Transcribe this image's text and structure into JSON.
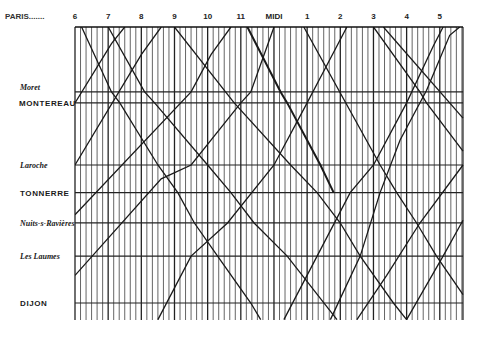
{
  "chart_data": {
    "type": "line",
    "title": "",
    "xlabel": "",
    "ylabel": "",
    "grid": true,
    "x_ticks": [
      {
        "hour": 6,
        "label": "6"
      },
      {
        "hour": 7,
        "label": "7"
      },
      {
        "hour": 8,
        "label": "8"
      },
      {
        "hour": 9,
        "label": "9"
      },
      {
        "hour": 10,
        "label": "10"
      },
      {
        "hour": 11,
        "label": "11"
      },
      {
        "hour": 12,
        "label": "MIDI"
      },
      {
        "hour": 13,
        "label": "1"
      },
      {
        "hour": 14,
        "label": "2"
      },
      {
        "hour": 15,
        "label": "3"
      },
      {
        "hour": 16,
        "label": "4"
      },
      {
        "hour": 17,
        "label": "5"
      }
    ],
    "xlim": [
      6,
      17.7
    ],
    "minor_ticks_per_hour": 6,
    "paris_leader": "PARIS.......",
    "stations": [
      {
        "name": "PARIS",
        "style": "roman",
        "pos": 0,
        "show_label": false
      },
      {
        "name": "Moret",
        "style": "italic",
        "pos": 0.235
      },
      {
        "name": "MONTEREAU",
        "style": "roman",
        "pos": 0.275
      },
      {
        "name": "Laroche",
        "style": "italic",
        "pos": 0.5
      },
      {
        "name": "TONNERRE",
        "style": "roman",
        "pos": 0.6
      },
      {
        "name": "Nuits-s-Ravières",
        "style": "italic",
        "pos": 0.71
      },
      {
        "name": "Les Laumes",
        "style": "italic",
        "pos": 0.83
      },
      {
        "name": "DIJON",
        "style": "roman",
        "pos": 1.0
      }
    ],
    "ylim": [
      0,
      1.06
    ],
    "series": [
      {
        "name": "train-down-1",
        "direction": "down",
        "points": [
          [
            6.2,
            0
          ],
          [
            7.1,
            0.235
          ],
          [
            7.35,
            0.275
          ],
          [
            8.5,
            0.5
          ],
          [
            9.1,
            0.6
          ],
          [
            9.6,
            0.71
          ],
          [
            10.3,
            0.83
          ],
          [
            11.3,
            1.0
          ],
          [
            11.6,
            1.06
          ]
        ]
      },
      {
        "name": "train-down-2",
        "direction": "down",
        "points": [
          [
            7.0,
            0
          ],
          [
            8.1,
            0.235
          ],
          [
            8.4,
            0.275
          ],
          [
            10.0,
            0.5
          ],
          [
            10.7,
            0.6
          ],
          [
            11.4,
            0.71
          ],
          [
            12.4,
            0.83
          ],
          [
            13.9,
            1.06
          ]
        ]
      },
      {
        "name": "train-down-3",
        "direction": "down",
        "points": [
          [
            9.0,
            0
          ],
          [
            10.8,
            0.275
          ],
          [
            12.5,
            0.5
          ],
          [
            13.3,
            0.6
          ],
          [
            14.0,
            0.71
          ],
          [
            14.6,
            0.83
          ],
          [
            15.6,
            1.0
          ],
          [
            16.0,
            1.06
          ]
        ]
      },
      {
        "name": "train-down-express",
        "direction": "down",
        "points": [
          [
            11.2,
            0
          ],
          [
            12.2,
            0.235
          ],
          [
            12.4,
            0.275
          ],
          [
            13.4,
            0.5
          ],
          [
            13.8,
            0.6
          ]
        ]
      },
      {
        "name": "train-down-4",
        "direction": "down",
        "points": [
          [
            12.9,
            0
          ],
          [
            15.2,
            0.5
          ],
          [
            15.7,
            0.6
          ],
          [
            16.3,
            0.71
          ],
          [
            16.9,
            0.83
          ],
          [
            17.7,
            0.97
          ]
        ]
      },
      {
        "name": "train-down-5",
        "direction": "down",
        "points": [
          [
            15.0,
            0
          ],
          [
            16.4,
            0.235
          ],
          [
            16.6,
            0.275
          ],
          [
            17.7,
            0.45
          ]
        ]
      },
      {
        "name": "train-down-6",
        "direction": "down",
        "points": [
          [
            15.3,
            0
          ],
          [
            17.7,
            0.33
          ]
        ]
      },
      {
        "name": "train-up-1",
        "direction": "up",
        "points": [
          [
            6.0,
            0.275
          ],
          [
            7.1,
            0.06
          ],
          [
            7.5,
            0
          ]
        ]
      },
      {
        "name": "train-up-2",
        "direction": "up",
        "points": [
          [
            6.0,
            0.5
          ],
          [
            8.0,
            0.1
          ],
          [
            8.6,
            0
          ]
        ]
      },
      {
        "name": "train-up-3",
        "direction": "up",
        "points": [
          [
            6.0,
            0.68
          ],
          [
            9.5,
            0.235
          ],
          [
            10.1,
            0.1
          ],
          [
            10.7,
            0
          ]
        ]
      },
      {
        "name": "train-up-4",
        "direction": "up",
        "points": [
          [
            6.0,
            0.9
          ],
          [
            8.6,
            0.55
          ],
          [
            9.5,
            0.5
          ],
          [
            11.0,
            0.275
          ],
          [
            11.3,
            0.235
          ],
          [
            12.0,
            0
          ]
        ]
      },
      {
        "name": "train-up-5",
        "direction": "up",
        "points": [
          [
            8.5,
            1.06
          ],
          [
            9.5,
            0.83
          ],
          [
            10.6,
            0.71
          ],
          [
            12.0,
            0.5
          ],
          [
            13.0,
            0.275
          ],
          [
            13.5,
            0.16
          ],
          [
            14.2,
            0
          ]
        ]
      },
      {
        "name": "train-up-6",
        "direction": "up",
        "points": [
          [
            12.3,
            1.06
          ],
          [
            13.3,
            0.83
          ],
          [
            14.3,
            0.6
          ],
          [
            15.0,
            0.5
          ],
          [
            16.0,
            0.275
          ],
          [
            16.8,
            0.07
          ],
          [
            17.1,
            0
          ]
        ]
      },
      {
        "name": "train-up-7",
        "direction": "up",
        "points": [
          [
            13.7,
            1.06
          ],
          [
            14.6,
            0.83
          ],
          [
            15.2,
            0.6
          ],
          [
            15.8,
            0.41
          ],
          [
            16.6,
            0.23
          ],
          [
            17.3,
            0.03
          ],
          [
            17.6,
            0
          ]
        ]
      },
      {
        "name": "train-up-8",
        "direction": "up",
        "points": [
          [
            14.5,
            1.06
          ],
          [
            15.4,
            0.9
          ],
          [
            16.4,
            0.71
          ],
          [
            17.7,
            0.5
          ]
        ]
      },
      {
        "name": "train-up-9",
        "direction": "up",
        "points": [
          [
            16.0,
            1.06
          ],
          [
            17.1,
            0.83
          ],
          [
            17.7,
            0.7
          ]
        ]
      }
    ]
  }
}
